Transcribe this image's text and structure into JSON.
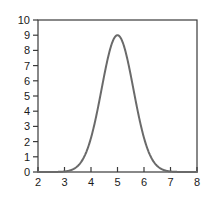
{
  "chart_data": {
    "type": "line",
    "title": "",
    "subtitle": "",
    "xlabel": "",
    "ylabel": "",
    "xlim": [
      2,
      8
    ],
    "ylim": [
      0,
      10
    ],
    "xticks": [
      2,
      3,
      4,
      5,
      6,
      7,
      8
    ],
    "yticks": [
      0,
      1,
      2,
      3,
      4,
      5,
      6,
      7,
      8,
      9,
      10
    ],
    "xtick_labels": [
      "2",
      "3",
      "4",
      "5",
      "6",
      "7",
      "8"
    ],
    "ytick_labels": [
      "0",
      "1",
      "2",
      "3",
      "4",
      "5",
      "6",
      "7",
      "8",
      "9",
      "10"
    ],
    "grid": false,
    "legend": null,
    "frame": "box",
    "annotations": [],
    "series": [
      {
        "name": "gaussian",
        "curve": "gaussian",
        "amplitude": 9,
        "mean": 5,
        "sigma": 0.6,
        "baseline": 0,
        "color": "#6a6a6a",
        "line_width": 2,
        "x": [
          2.0,
          2.2,
          2.4,
          2.6,
          2.8,
          3.0,
          3.2,
          3.4,
          3.6,
          3.8,
          4.0,
          4.2,
          4.4,
          4.6,
          4.8,
          5.0,
          5.2,
          5.4,
          5.6,
          5.8,
          6.0,
          6.2,
          6.4,
          6.6,
          6.8,
          7.0,
          7.2,
          7.4,
          7.6,
          7.8,
          8.0
        ],
        "values": [
          0.0,
          0.0,
          0.0,
          0.01,
          0.03,
          0.1,
          0.27,
          0.65,
          1.4,
          2.65,
          4.38,
          6.33,
          8.03,
          9.0,
          8.03,
          9.0,
          8.03,
          6.33,
          4.38,
          2.65,
          1.4,
          0.65,
          0.27,
          0.1,
          0.03,
          0.01,
          0.0,
          0.0,
          0.0,
          0.0,
          0.0
        ]
      }
    ]
  },
  "style": {
    "axis_color": "#3a3a3a",
    "curve_color": "#6a6a6a",
    "text_color": "#1a1a1a",
    "background": "#ffffff"
  },
  "geometry": {
    "plot_left": 38,
    "plot_right": 197,
    "plot_top": 20,
    "plot_bottom": 172,
    "tick_len_y": 5,
    "tick_len_x": 5
  }
}
